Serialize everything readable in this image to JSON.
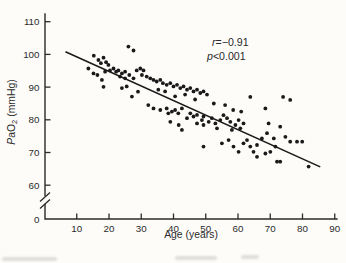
{
  "figure": {
    "background": "#fdfcf9",
    "ink": "#1a1a1a",
    "axis_color": "#2b2b2b"
  },
  "chart_data": {
    "type": "scatter",
    "title": "",
    "xlabel": "Age (years)",
    "ylabel": "PaO2 (mmHg)",
    "ylabel_parts": [
      {
        "t": "P",
        "italic": true
      },
      {
        "t": "a"
      },
      {
        "t": "O"
      },
      {
        "t": "2",
        "sub": true
      },
      {
        "t": " (mmHg)"
      }
    ],
    "x_ticks": [
      10,
      20,
      30,
      40,
      50,
      60,
      70,
      80,
      90
    ],
    "y_ticks": [
      110,
      100,
      90,
      80,
      70,
      60
    ],
    "y_origin_label": "0",
    "y_axis_break": true,
    "xlim": [
      0,
      90
    ],
    "ylim_displayed": [
      60,
      110
    ],
    "grid": false,
    "legend": "none",
    "stats": {
      "r": -0.91,
      "p": "<0.001"
    },
    "annotations": [
      {
        "variable": "r",
        "rest": "=−0.91"
      },
      {
        "variable": "p",
        "rest": "<0.001"
      }
    ],
    "regression_line": {
      "x1": 6.5,
      "y1": 100.8,
      "x2": 85.5,
      "y2": 65.6
    },
    "points": [
      [
        13.6,
        95.7
      ],
      [
        15.2,
        94.2
      ],
      [
        15.3,
        99.6
      ],
      [
        16.4,
        93.7
      ],
      [
        16.7,
        98.3
      ],
      [
        17.5,
        97.3
      ],
      [
        17.8,
        92.2
      ],
      [
        18.3,
        99.0
      ],
      [
        18.3,
        90.1
      ],
      [
        18.8,
        94.7
      ],
      [
        19.1,
        97.6
      ],
      [
        19.8,
        96.8
      ],
      [
        20.3,
        95.1
      ],
      [
        21.4,
        95.7
      ],
      [
        22.2,
        94.7
      ],
      [
        22.9,
        95.1
      ],
      [
        23.4,
        93.2
      ],
      [
        24.0,
        94.2
      ],
      [
        24.0,
        89.7
      ],
      [
        25.0,
        94.7
      ],
      [
        25.0,
        92.7
      ],
      [
        25.5,
        90.2
      ],
      [
        26.0,
        102.4
      ],
      [
        27.6,
        101.2
      ],
      [
        26.3,
        93.7
      ],
      [
        27.1,
        87.1
      ],
      [
        27.6,
        92.7
      ],
      [
        28.6,
        95.1
      ],
      [
        29.0,
        88.6
      ],
      [
        29.7,
        95.7
      ],
      [
        30.2,
        93.7
      ],
      [
        30.7,
        95.1
      ],
      [
        31.7,
        93.2
      ],
      [
        32.2,
        84.5
      ],
      [
        32.8,
        92.7
      ],
      [
        33.8,
        92.2
      ],
      [
        33.8,
        83.5
      ],
      [
        34.8,
        91.7
      ],
      [
        35.3,
        89.2
      ],
      [
        35.9,
        92.2
      ],
      [
        35.9,
        83.0
      ],
      [
        36.7,
        91.2
      ],
      [
        37.4,
        88.7
      ],
      [
        37.9,
        90.7
      ],
      [
        37.9,
        83.5
      ],
      [
        38.4,
        82.0
      ],
      [
        39.0,
        91.2
      ],
      [
        39.0,
        79.4
      ],
      [
        39.5,
        82.5
      ],
      [
        40.0,
        90.2
      ],
      [
        40.5,
        87.2
      ],
      [
        40.5,
        83.0
      ],
      [
        41.1,
        90.7
      ],
      [
        41.5,
        82.0
      ],
      [
        41.6,
        78.4
      ],
      [
        42.1,
        89.7
      ],
      [
        42.6,
        83.5
      ],
      [
        42.6,
        76.9
      ],
      [
        43.1,
        90.2
      ],
      [
        43.6,
        87.7
      ],
      [
        44.2,
        89.2
      ],
      [
        44.2,
        80.5
      ],
      [
        45.2,
        89.7
      ],
      [
        45.2,
        82.0
      ],
      [
        46.2,
        88.7
      ],
      [
        46.2,
        81.0
      ],
      [
        46.7,
        86.2
      ],
      [
        47.3,
        89.2
      ],
      [
        47.3,
        81.5
      ],
      [
        47.3,
        78.9
      ],
      [
        48.3,
        88.2
      ],
      [
        48.8,
        79.9
      ],
      [
        49.3,
        88.7
      ],
      [
        49.3,
        81.0
      ],
      [
        49.3,
        78.4
      ],
      [
        49.3,
        71.8
      ],
      [
        50.4,
        87.7
      ],
      [
        50.9,
        79.4
      ],
      [
        51.9,
        80.5
      ],
      [
        52.5,
        85.0
      ],
      [
        53.0,
        78.9
      ],
      [
        53.5,
        77.4
      ],
      [
        54.5,
        79.9
      ],
      [
        55.0,
        72.8
      ],
      [
        55.5,
        81.4
      ],
      [
        56.0,
        84.5
      ],
      [
        56.6,
        80.5
      ],
      [
        57.1,
        73.8
      ],
      [
        57.6,
        79.4
      ],
      [
        58.1,
        76.9
      ],
      [
        58.5,
        83.0
      ],
      [
        58.6,
        71.8
      ],
      [
        59.2,
        78.4
      ],
      [
        60.2,
        79.9
      ],
      [
        60.2,
        70.2
      ],
      [
        60.7,
        77.4
      ],
      [
        61.0,
        82.5
      ],
      [
        61.7,
        78.9
      ],
      [
        61.7,
        72.8
      ],
      [
        62.8,
        73.8
      ],
      [
        63.8,
        87.0
      ],
      [
        63.8,
        71.8
      ],
      [
        64.8,
        70.2
      ],
      [
        65.9,
        72.3
      ],
      [
        65.9,
        68.7
      ],
      [
        67.4,
        74.3
      ],
      [
        68.5,
        83.5
      ],
      [
        68.5,
        69.7
      ],
      [
        69.0,
        75.9
      ],
      [
        69.5,
        78.9
      ],
      [
        70.0,
        70.2
      ],
      [
        71.1,
        74.3
      ],
      [
        71.6,
        71.8
      ],
      [
        72.1,
        67.2
      ],
      [
        73.1,
        77.9
      ],
      [
        73.1,
        67.2
      ],
      [
        74.0,
        87.0
      ],
      [
        74.7,
        74.8
      ],
      [
        76.2,
        86.1
      ],
      [
        76.2,
        73.3
      ],
      [
        78.3,
        73.3
      ],
      [
        79.9,
        73.3
      ],
      [
        81.9,
        65.7
      ]
    ]
  }
}
